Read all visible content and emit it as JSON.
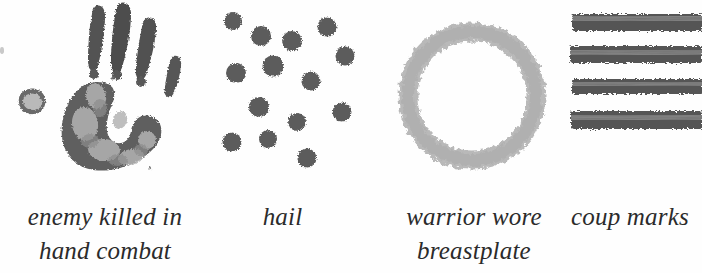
{
  "figure": {
    "background_color": "#fefefe",
    "ink_dark": "#4a4a4a",
    "ink_mid": "#6b6b6b",
    "ink_light": "#b8b8b8",
    "caption_color": "#2b2b2b"
  },
  "panels": [
    {
      "name": "handprint",
      "glyph": "handprint-glyph",
      "caption_lines": [
        "enemy killed in",
        "hand combat"
      ],
      "caption_full": "enemy killed in hand combat"
    },
    {
      "name": "hail",
      "glyph": "hail-dots-glyph",
      "caption_lines": [
        "hail"
      ],
      "caption_full": "hail"
    },
    {
      "name": "breastplate",
      "glyph": "ring-glyph",
      "caption_lines": [
        "warrior wore",
        "breastplate"
      ],
      "caption_full": "warrior wore breastplate"
    },
    {
      "name": "coup-marks",
      "glyph": "four-bars-glyph",
      "caption_lines": [
        "coup marks"
      ],
      "caption_full": "coup marks"
    }
  ]
}
